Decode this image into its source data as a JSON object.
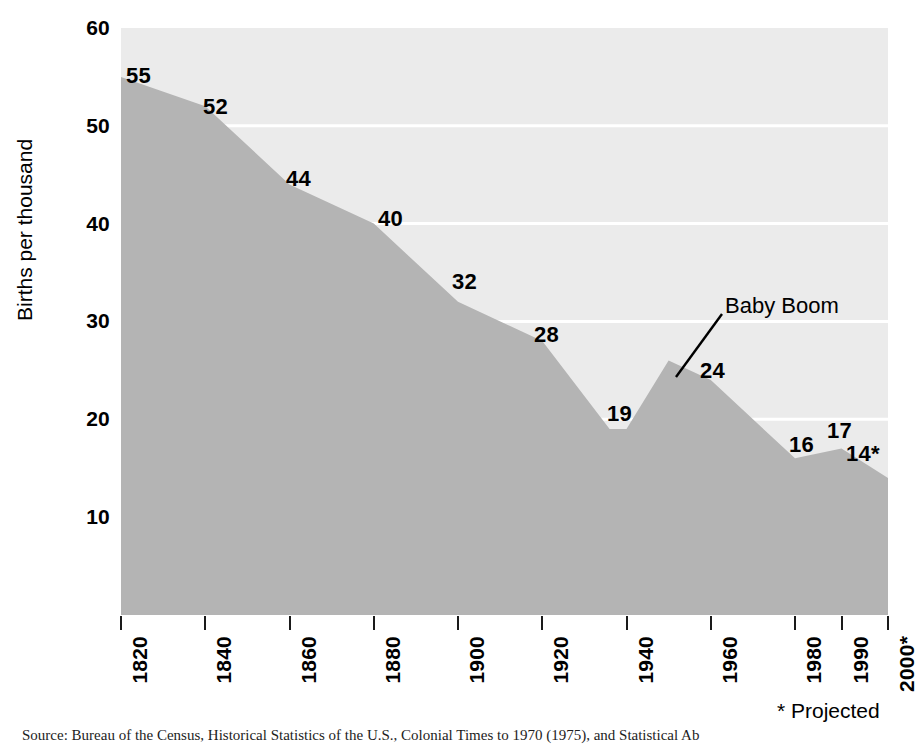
{
  "chart_data": {
    "type": "area",
    "title": "",
    "xlabel": "",
    "ylabel": "Births per thousand",
    "xlim": [
      1820,
      2000
    ],
    "ylim": [
      0,
      60
    ],
    "grid": true,
    "legend_position": "none",
    "categories": [
      "1820",
      "1840",
      "1860",
      "1880",
      "1900",
      "1920",
      "1940",
      "1960",
      "1980",
      "1990",
      "2000*"
    ],
    "x": [
      1820,
      1840,
      1860,
      1880,
      1900,
      1920,
      1940,
      1960,
      1980,
      1990,
      2000
    ],
    "values": [
      55,
      52,
      44,
      40,
      32,
      28,
      19,
      24,
      16,
      17,
      14
    ],
    "point_labels": [
      "55",
      "52",
      "44",
      "40",
      "32",
      "28",
      "19",
      "24",
      "16",
      "17",
      "14*"
    ],
    "interior_vertices": [
      {
        "x": 1936,
        "y": 19
      },
      {
        "x": 1950,
        "y": 26
      }
    ],
    "y_ticks": [
      10,
      20,
      30,
      40,
      50,
      60
    ],
    "y_tick_labels": [
      "10",
      "20",
      "30",
      "40",
      "50",
      "60"
    ],
    "x_ticks": [
      1820,
      1840,
      1860,
      1880,
      1900,
      1920,
      1940,
      1960,
      1980,
      1990,
      2000
    ],
    "annotations": [
      {
        "text": "Baby Boom",
        "points_to_x": 1950,
        "points_to_y": 26
      }
    ],
    "footnote": "* Projected",
    "colors": {
      "area_fill": "#b4b4b4",
      "plot_background": "#ebebeb",
      "gridline": "#ffffff",
      "text": "#000000"
    }
  },
  "axes": {
    "y_title": "Births per thousand"
  },
  "annotation": {
    "baby_boom": "Baby Boom"
  },
  "footnote": {
    "projected": "* Projected"
  },
  "caption": {
    "source": "Source: Bureau of the Census, Historical Statistics of the U.S., Colonial Times to 1970 (1975), and Statistical Ab"
  },
  "labels": {
    "y_ticks": [
      "60",
      "50",
      "40",
      "30",
      "20",
      "10"
    ],
    "x_ticks": [
      "1820",
      "1840",
      "1860",
      "1880",
      "1900",
      "1920",
      "1940",
      "1960",
      "1980",
      "1990",
      "2000"
    ],
    "points": [
      "55",
      "52",
      "44",
      "40",
      "32",
      "28",
      "19",
      "24",
      "16",
      "17",
      "14*"
    ]
  }
}
